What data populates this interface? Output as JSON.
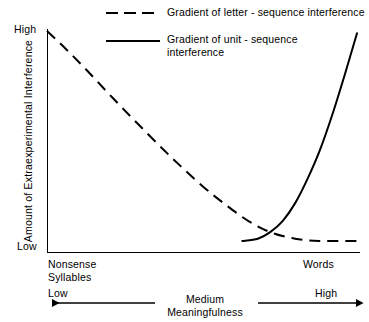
{
  "chart_data": {
    "type": "line",
    "title": "",
    "xlabel": "Meaningfulness",
    "ylabel": "Amount of Extraexperimental Interference",
    "xlim": [
      0,
      100
    ],
    "ylim": [
      0,
      100
    ],
    "grid": false,
    "legend_position": "top",
    "x_axis": {
      "low_label": "Low",
      "medium_label": "Medium",
      "high_label": "High",
      "scale_name": "Meaningfulness",
      "left_category": "Nonsense\nSyllables",
      "right_category": "Words",
      "medium_block": "Medium\nMeaningfulness"
    },
    "y_axis": {
      "high_label": "High",
      "low_label": "Low",
      "title": "Amount of Extraexperimental Interference"
    },
    "series": [
      {
        "name": "Gradient of letter - sequence interference",
        "style": "dashed",
        "color": "#000000",
        "x": [
          0,
          6,
          13,
          21,
          30,
          40,
          50,
          58,
          65,
          72,
          80,
          88,
          96,
          100
        ],
        "values": [
          100,
          92,
          82,
          70,
          57,
          43,
          30,
          21,
          14,
          9,
          6,
          5,
          5,
          5
        ]
      },
      {
        "name": "Gradient of unit - sequence interference",
        "style": "solid",
        "color": "#000000",
        "x": [
          63,
          68,
          72,
          76,
          80,
          84,
          88,
          92,
          96,
          100
        ],
        "values": [
          5,
          6,
          9,
          14,
          22,
          33,
          46,
          62,
          80,
          99
        ]
      }
    ]
  },
  "legend": {
    "items": [
      {
        "label": "Gradient of letter - sequence interference",
        "style": "dashed"
      },
      {
        "label": "Gradient of unit - sequence\ninterference",
        "style": "solid"
      }
    ]
  }
}
